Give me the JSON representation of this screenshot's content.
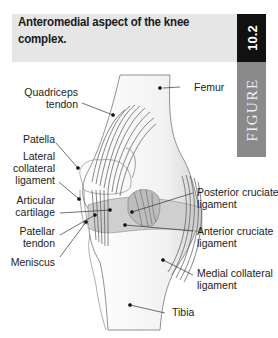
{
  "figure": {
    "caption": "Anteromedial aspect of the knee complex.",
    "number": "10.2",
    "word": "FIGURE"
  },
  "labels": {
    "quadriceps": [
      "Quadriceps",
      "tendon"
    ],
    "patella": [
      "Patella"
    ],
    "lateral_collateral": [
      "Lateral",
      "collateral",
      "ligament"
    ],
    "articular_cartilage": [
      "Articular",
      "cartilage"
    ],
    "patellar_tendon": [
      "Patellar",
      "tendon"
    ],
    "meniscus": [
      "Meniscus"
    ],
    "femur": [
      "Femur"
    ],
    "posterior_cruciate": [
      "Posterior cruciate",
      "ligament"
    ],
    "anterior_cruciate": [
      "Anterior cruciate",
      "ligament"
    ],
    "medial_collateral": [
      "Medial collateral",
      "ligament"
    ],
    "tibia": [
      "Tibia"
    ]
  },
  "colors": {
    "caption_band": "#e6e6e6",
    "number_tab": "#111111",
    "word_tab": "#8a8a8a",
    "line": "#333333"
  }
}
